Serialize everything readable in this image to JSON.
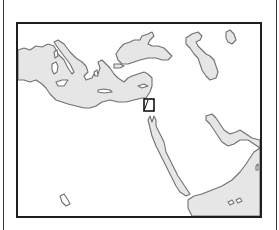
{
  "map": {
    "type": "locator-map",
    "region": "Mediterranean and Middle East",
    "colors": {
      "sea_fill": "#e6e6e6",
      "land_fill": "#ffffff",
      "coastline": "#707070",
      "frame": "#1e1e1e",
      "highlight_box": "#111111"
    },
    "features": {
      "seas": [
        "Mediterranean Sea",
        "Black Sea",
        "Caspian Sea",
        "Red Sea",
        "Persian Gulf",
        "Arabian Sea"
      ],
      "highlight": {
        "shape": "rectangle",
        "location": "eastern Mediterranean coast"
      }
    }
  }
}
